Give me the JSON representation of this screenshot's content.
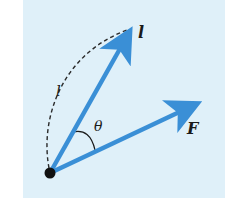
{
  "diagram": {
    "background_color": "#dff0f9",
    "arrow_color": "#3a8fd6",
    "ink_color": "#1a1a1a",
    "labels": {
      "vector_l": "l",
      "arc_length_l": "l",
      "angle": "θ",
      "vector_F": "F"
    },
    "elements": {
      "origin_point": {
        "x": 50,
        "y": 173
      },
      "vector_l_tip": {
        "x": 130,
        "y": 30
      },
      "vector_F_tip": {
        "x": 198,
        "y": 103
      }
    }
  }
}
